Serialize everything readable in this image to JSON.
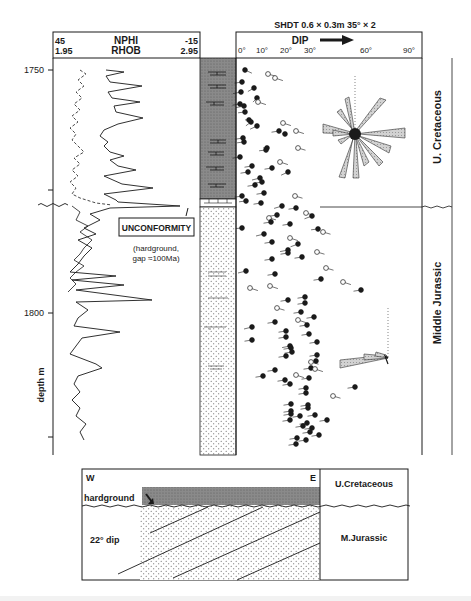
{
  "log_panel": {
    "curve1_name": "NPHI",
    "curve1_left": "45",
    "curve1_right": "-15",
    "curve2_name": "RHOB",
    "curve2_left": "1.95",
    "curve2_right": "2.95"
  },
  "depth_axis": {
    "label": "depth m",
    "ticks": [
      {
        "value": "1750",
        "y": 70
      },
      {
        "value": "",
        "y": 190
      },
      {
        "value": "1800",
        "y": 313
      },
      {
        "value": "",
        "y": 437
      }
    ]
  },
  "dipmeter_panel": {
    "title": "SHDT 0.6 × 0.3m   35° × 2",
    "axis_label": "DIP",
    "ticks": [
      "0°",
      "10°",
      "20°",
      "30°",
      "60°",
      "90°"
    ]
  },
  "annotations": {
    "unconformity_box": "UNCONFORMITY",
    "unconformity_note_line1": "(hardground,",
    "unconformity_note_line2": "gap ≈100Ma)"
  },
  "stratigraphy": {
    "upper": "U. Cretaceous",
    "lower": "Middle Jurassic"
  },
  "cross_section": {
    "west": "W",
    "east": "E",
    "hardground_label": "hardground",
    "dip_label": "22° dip",
    "upper_unit": "U.Cretaceous",
    "lower_unit": "M.Jurassic"
  },
  "colors": {
    "ink": "#1a1a1a",
    "shale_fill": "#7a7a7a",
    "rose_fill": "#c8c8c8",
    "sand_dot": "#555555"
  }
}
